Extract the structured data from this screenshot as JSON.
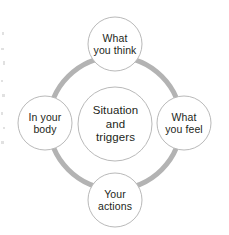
{
  "diagram": {
    "type": "cycle-diagram",
    "colors": {
      "ring": "#b3b3b3",
      "node_outline": "#b9b9b9",
      "node_fill": "#ffffff",
      "text": "#231f20",
      "background": "#ffffff"
    },
    "ring": {
      "center_x": 115,
      "center_y": 123,
      "radius": 66,
      "stroke_width": 5
    },
    "center_node": {
      "id": "center",
      "label": "Situation\nand\ntriggers",
      "cx": 115,
      "cy": 124,
      "r": 37
    },
    "nodes": [
      {
        "id": "top",
        "label": "What\nyou think",
        "position": "top",
        "cx": 115,
        "cy": 44,
        "r": 27
      },
      {
        "id": "right",
        "label": "What\nyou feel",
        "position": "right",
        "cx": 184,
        "cy": 123,
        "r": 27
      },
      {
        "id": "bottom",
        "label": "Your\nactions",
        "position": "bottom",
        "cx": 115,
        "cy": 200,
        "r": 27
      },
      {
        "id": "left",
        "label": "In your\nbody",
        "position": "left",
        "cx": 45,
        "cy": 123,
        "r": 27
      }
    ]
  }
}
